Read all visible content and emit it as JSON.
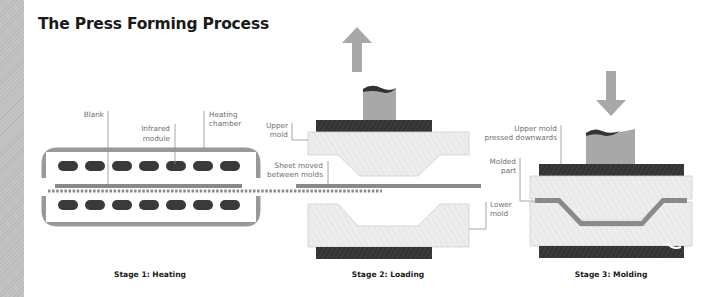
{
  "title": "The Press Forming Process",
  "colors": {
    "chamber": "#9a9a9a",
    "heater": "#3a3a3a",
    "sheet": "#8a8a8a",
    "mold_fill": "#ececec",
    "mold_stroke": "#c8c8c8",
    "press_plate": "#333333",
    "ram": "#a8a8a8",
    "arrow": "#a8a8a8",
    "leader": "#9a9a9a",
    "label_text": "#6f6f6f",
    "stage_text": "#1a1a1a"
  },
  "stages": [
    {
      "id": "heating",
      "caption": "Stage 1: Heating",
      "labels": {
        "blank": "Blank",
        "infrared_1": "Infrared",
        "infrared_2": "module",
        "chamber_1": "Heating",
        "chamber_2": "chamber"
      }
    },
    {
      "id": "loading",
      "caption": "Stage 2: Loading",
      "arrow": "up",
      "labels": {
        "upper_1": "Upper",
        "upper_2": "mold",
        "sheet_1": "Sheet moved",
        "sheet_2": "between molds",
        "lower_1": "Lower",
        "lower_2": "mold"
      }
    },
    {
      "id": "molding",
      "caption": "Stage 3: Molding",
      "arrow": "down",
      "labels": {
        "pressed_1": "Upper mold",
        "pressed_2": "pressed downwards",
        "part_1": "Molded",
        "part_2": "part"
      }
    }
  ]
}
